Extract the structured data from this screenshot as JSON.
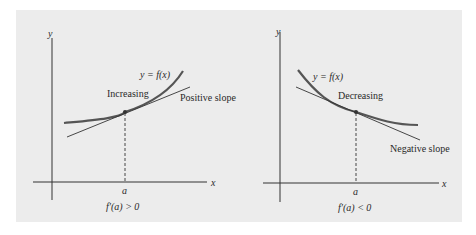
{
  "panels": [
    {
      "id": "increasing",
      "axis_x_label": "x",
      "axis_y_label": "y",
      "curve_label": "y = f(x)",
      "behavior_label": "Increasing",
      "tangent_label": "Positive slope",
      "point_label": "a",
      "condition": "f′(a) > 0"
    },
    {
      "id": "decreasing",
      "axis_x_label": "x",
      "axis_y_label": "y",
      "curve_label": "y = f(x)",
      "behavior_label": "Decreasing",
      "tangent_label": "Negative slope",
      "point_label": "a",
      "condition": "f′(a) < 0"
    }
  ],
  "colors": {
    "background": "#ececec",
    "curve": "#555555",
    "lines": "#333333"
  }
}
